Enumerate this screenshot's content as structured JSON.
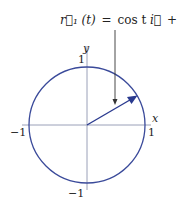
{
  "diagram": {
    "equation": {
      "lhs": "r⃗₁ (t)",
      "equals": "=",
      "cos_part": "cos t",
      "i_vec": "i⃗",
      "plus": "+",
      "sin_part": "sin t",
      "j_vec": "j⃗"
    },
    "axes": {
      "x_label": "x",
      "y_label": "y",
      "x_pos_tick": "1",
      "x_neg_tick": "−1",
      "y_pos_tick": "1",
      "y_neg_tick": "−1"
    },
    "colors": {
      "circle": "#3a4a9a",
      "vector": "#2a3a8f",
      "axes": "#9aa0b8",
      "pointer": "#333333",
      "text": "#222222"
    },
    "geometry": {
      "center": [
        87,
        125
      ],
      "radius": 58,
      "vector_angle_deg": 30
    }
  }
}
